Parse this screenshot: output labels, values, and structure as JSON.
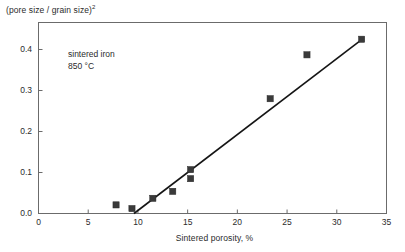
{
  "chart_data": {
    "type": "scatter",
    "title": "",
    "ylabel": "(pore size / grain size)",
    "ylabel_exponent": "2",
    "xlabel": "Sintered porosity, %",
    "xlim": [
      0,
      35
    ],
    "ylim": [
      0.0,
      0.45
    ],
    "xticks": [
      0,
      5,
      10,
      15,
      20,
      25,
      30,
      35
    ],
    "xtick_labels": [
      "0",
      "5",
      "10",
      "15",
      "20",
      "25",
      "30",
      "35"
    ],
    "yticks": [
      0.0,
      0.1,
      0.2,
      0.3,
      0.4
    ],
    "ytick_labels": [
      "0.0",
      "0.1",
      "0.2",
      "0.3",
      "0.4"
    ],
    "grid": false,
    "legend": null,
    "marker": "filled-square",
    "marker_color": "#3a3a3a",
    "line_color": "#151515",
    "axis_color": "#6b6b6b",
    "annotations": [
      {
        "text": "sintered iron",
        "x": 11.5,
        "y": 0.355
      },
      {
        "text": "850 °C",
        "x": 11.5,
        "y": 0.325
      }
    ],
    "series": [
      {
        "name": "sintered iron 850 °C",
        "points": [
          {
            "x": 7.8,
            "y": 0.021
          },
          {
            "x": 9.4,
            "y": 0.012
          },
          {
            "x": 11.5,
            "y": 0.037
          },
          {
            "x": 13.5,
            "y": 0.054
          },
          {
            "x": 15.3,
            "y": 0.107
          },
          {
            "x": 15.3,
            "y": 0.085
          },
          {
            "x": 23.3,
            "y": 0.28
          },
          {
            "x": 27.0,
            "y": 0.387
          },
          {
            "x": 32.5,
            "y": 0.425
          }
        ]
      }
    ],
    "trend_line": {
      "x0": 9.6,
      "y0": 0.0,
      "x1": 32.7,
      "y1": 0.428
    }
  }
}
